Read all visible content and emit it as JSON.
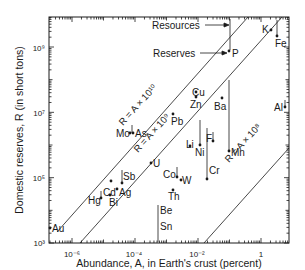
{
  "chart_data": {
    "type": "scatter",
    "title": "",
    "xlabel": "Abundance, A, in Earth's crust (percent)",
    "ylabel": "Domestic reserves, R (in short tons)",
    "xscale": "log",
    "yscale": "log",
    "xlim": [
      1.9e-07,
      7.5
    ],
    "ylim": [
      1000.0,
      8000000000.0
    ],
    "x_ticks": [
      {
        "value": 1e-06,
        "label": "10⁻⁶"
      },
      {
        "value": 0.0001,
        "label": "10⁻⁴"
      },
      {
        "value": 0.01,
        "label": "10⁻²"
      },
      {
        "value": 1,
        "label": "1"
      }
    ],
    "y_ticks": [
      {
        "value": 1000.0,
        "label": "10³"
      },
      {
        "value": 100000.0,
        "label": "10⁵"
      },
      {
        "value": 10000000.0,
        "label": "10⁷"
      },
      {
        "value": 1000000000.0,
        "label": "10⁹"
      }
    ],
    "grid": false,
    "legend": null,
    "reference_lines": [
      {
        "label": "R = A × 10¹⁰",
        "k": 10
      },
      {
        "label": "R = A × 10⁹",
        "k": 9
      },
      {
        "label": "R = A × 10⁸",
        "k": 8
      }
    ],
    "annotations": [
      {
        "text": "Resources",
        "points_to": "top of P resource bar"
      },
      {
        "text": "Reserves",
        "points_to": "P reserves point"
      }
    ],
    "points": [
      {
        "element": "K",
        "abundance": 2.1,
        "reserves": 2500000000.0,
        "resources": null
      },
      {
        "element": "Fe",
        "abundance": 4.2,
        "reserves": 1800000000.0,
        "resources": 6000000000.0
      },
      {
        "element": "P",
        "abundance": 0.1,
        "reserves": 800000000.0,
        "resources": 6000000000.0
      },
      {
        "element": "Al",
        "abundance": 8.0,
        "reserves": 15000000.0,
        "resources": 40000000.0
      },
      {
        "element": "Cu",
        "abundance": 0.0055,
        "reserves": 85000000.0,
        "resources": null
      },
      {
        "element": "Zn",
        "abundance": 0.0055,
        "reserves": 60000000.0,
        "resources": null
      },
      {
        "element": "Ba",
        "abundance": 0.04,
        "reserves": 20000000.0,
        "resources": null
      },
      {
        "element": "Pb",
        "abundance": 0.0012,
        "reserves": 15000000.0,
        "resources": null
      },
      {
        "element": "F",
        "abundance": 0.06,
        "reserves": 4000000.0,
        "resources": 10000000.0
      },
      {
        "element": "Mn",
        "abundance": 0.1,
        "reserves": 2500000.0,
        "resources": 700000000.0
      },
      {
        "element": "Mo",
        "abundance": 0.00012,
        "reserves": 3000000.0,
        "resources": null
      },
      {
        "element": "As",
        "abundance": 0.00018,
        "reserves": 3000000.0,
        "resources": 10000000.0
      },
      {
        "element": "Li",
        "abundance": 0.0035,
        "reserves": 1400000.0,
        "resources": null
      },
      {
        "element": "Ni",
        "abundance": 0.0075,
        "reserves": 1600000.0,
        "resources": 13000000.0
      },
      {
        "element": "U",
        "abundance": 0.00022,
        "reserves": 600000.0,
        "resources": null
      },
      {
        "element": "Cr",
        "abundance": 0.012,
        "reserves": 230000.0,
        "resources": 8000000.0
      },
      {
        "element": "Sb",
        "abundance": 2e-05,
        "reserves": 180000.0,
        "resources": 350000.0
      },
      {
        "element": "Co",
        "abundance": 0.0025,
        "reserves": 200000.0,
        "resources": 400000.0
      },
      {
        "element": "W",
        "abundance": 0.00015,
        "reserves": 160000.0,
        "resources": null
      },
      {
        "element": "Cd",
        "abundance": 1.5e-05,
        "reserves": 100000.0,
        "resources": null
      },
      {
        "element": "Ag",
        "abundance": 1e-05,
        "reserves": 70000.0,
        "resources": null
      },
      {
        "element": "Th",
        "abundance": 0.00096,
        "reserves": 55000.0,
        "resources": null
      },
      {
        "element": "Hg",
        "abundance": 8e-06,
        "reserves": 45000.0,
        "resources": 70000.0
      },
      {
        "element": "Bi",
        "abundance": 1.4e-05,
        "reserves": 40000.0,
        "resources": null
      },
      {
        "element": "Be",
        "abundance": 0.00028,
        "reserves": 1200.0,
        "resources": 30000.0
      },
      {
        "element": "Sn",
        "abundance": 0.00022,
        "reserves": 1100.0,
        "resources": 6000.0
      },
      {
        "element": "Au",
        "abundance": 4e-07,
        "reserves": 2000.0,
        "resources": null
      }
    ]
  },
  "labels": {
    "x_axis_title": "Abundance, A, in Earth's crust (percent)",
    "y_axis_title": "Domestic reserves, R (in short tons)",
    "resources": "Resources",
    "reserves": "Reserves",
    "line_10": "R = A × 10¹⁰",
    "line_9": "R = A × 10⁹",
    "line_8": "R = A × 10⁸",
    "x_tick_1": "10⁻⁶",
    "x_tick_2": "10⁻⁴",
    "x_tick_3": "10⁻²",
    "x_tick_4": "1",
    "y_tick_1": "10³",
    "y_tick_2": "10⁵",
    "y_tick_3": "10⁷",
    "y_tick_4": "10⁹"
  },
  "elements": {
    "K": "K",
    "Fe": "Fe",
    "P": "P",
    "Al": "Al",
    "Cu": "Cu",
    "Zn": "Zn",
    "Ba": "Ba",
    "Pb": "Pb",
    "F": "F",
    "Mn": "Mn",
    "Mo": "Mo",
    "As": "As",
    "Li": "Li",
    "Ni": "Ni",
    "U": "U",
    "Cr": "Cr",
    "Sb": "Sb",
    "Co": "Co",
    "W": "W",
    "Cd": "Cd",
    "Ag": "Ag",
    "Th": "Th",
    "Hg": "Hg",
    "Bi": "Bi",
    "Be": "Be",
    "Sn": "Sn",
    "Au": "Au"
  }
}
